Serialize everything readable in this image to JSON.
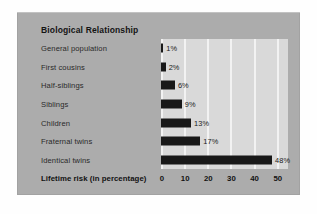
{
  "figure": {
    "title": "Biological Relationship",
    "axis_title": "Lifetime risk (in percentage)"
  },
  "chart_data": {
    "type": "bar",
    "orientation": "horizontal",
    "title": "Biological Relationship",
    "xlabel": "Lifetime risk (in percentage)",
    "ylabel": "Biological Relationship",
    "xlim": [
      0,
      54
    ],
    "xticks": [
      0,
      10,
      20,
      30,
      40,
      50
    ],
    "xtick_labels": [
      "0",
      "10",
      "20",
      "30",
      "40",
      "50"
    ],
    "grid": "vertical white gridlines at each tick",
    "legend": "none",
    "bar_color": "#181818",
    "plot_background": "#d9d9d9",
    "panel_background": "#acacac",
    "categories": [
      "General population",
      "First cousins",
      "Half-siblings",
      "Siblings",
      "Children",
      "Fraternal twins",
      "Identical twins"
    ],
    "values": [
      1,
      2,
      6,
      9,
      13,
      17,
      48
    ],
    "value_labels": [
      "1%",
      "2%",
      "6%",
      "9%",
      "13%",
      "17%",
      "48%"
    ],
    "rows": [
      {
        "label": "General population",
        "value": 1,
        "value_label": "1%"
      },
      {
        "label": "First cousins",
        "value": 2,
        "value_label": "2%"
      },
      {
        "label": "Half-siblings",
        "value": 6,
        "value_label": "6%"
      },
      {
        "label": "Siblings",
        "value": 9,
        "value_label": "9%"
      },
      {
        "label": "Children",
        "value": 13,
        "value_label": "13%"
      },
      {
        "label": "Fraternal twins",
        "value": 17,
        "value_label": "17%"
      },
      {
        "label": "Identical twins",
        "value": 48,
        "value_label": "48%"
      }
    ]
  }
}
